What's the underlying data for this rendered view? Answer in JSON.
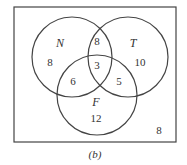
{
  "diagram": {
    "type": "venn",
    "sets": {
      "N": "N",
      "T": "T",
      "F": "F"
    },
    "regions": {
      "N_only": "8",
      "N_T": "8",
      "T_only": "10",
      "N_T_F": "3",
      "N_F": "6",
      "T_F": "5",
      "F_only": "12",
      "outside": "8"
    },
    "caption": "(b)"
  }
}
